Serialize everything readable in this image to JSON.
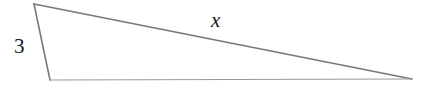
{
  "figure": {
    "kind": "triangle-diagram",
    "background_color": "#ffffff",
    "canvas": {
      "width": 425,
      "height": 94
    },
    "stroke": {
      "primary_color": "#787878",
      "secondary_color": "#9a9a9a",
      "primary_width": 1.6,
      "secondary_width": 1.2
    },
    "vertices": {
      "top_left": {
        "x": 34,
        "y": 4
      },
      "bottom_left": {
        "x": 50,
        "y": 80
      },
      "right_apex": {
        "x": 412,
        "y": 79
      }
    },
    "sides": [
      {
        "name": "left-side",
        "from": "top_left",
        "to": "bottom_left",
        "label": "3",
        "label_style": "upright"
      },
      {
        "name": "hypotenuse",
        "from": "top_left",
        "to": "right_apex",
        "label": "x",
        "label_style": "italic"
      },
      {
        "name": "base",
        "from": "bottom_left",
        "to": "right_apex",
        "label": "",
        "label_style": "none"
      }
    ],
    "labels": {
      "short_side": "3",
      "hypotenuse": "x"
    }
  }
}
